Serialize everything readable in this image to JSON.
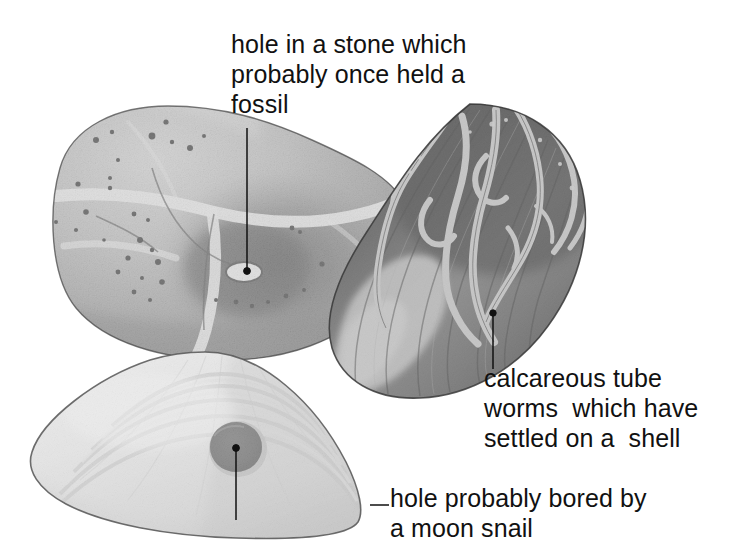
{
  "figure": {
    "kind": "labelled natural-history illustration",
    "background_color": "#ffffff",
    "ink_color": "#111111"
  },
  "labels": [
    {
      "id": "stone-hole",
      "name": "hole-in-stone-label",
      "text": "hole in a stone which\nprobably once held a\nfossil",
      "lines": [
        "hole in a stone which",
        "probably once held a",
        "fossil"
      ],
      "x": 231,
      "y": 29
    },
    {
      "id": "tube-worms",
      "name": "calcareous-tube-worms-label",
      "text": "calcareous tube\nworms  which have\nsettled on a  shell",
      "lines": [
        "calcareous tube",
        "worms  which have",
        "settled on a  shell"
      ],
      "x": 484,
      "y": 363
    },
    {
      "id": "moon-snail-hole",
      "name": "moon-snail-hole-label",
      "text": "hole probably bored by\na moon snail",
      "lines": [
        "hole probably bored by",
        "a moon snail"
      ],
      "x": 390,
      "y": 483
    }
  ],
  "leaders": [
    {
      "id": "leader-stone",
      "from": [
        247,
        128
      ],
      "to": [
        247,
        272
      ],
      "dot_at": [
        247,
        272
      ]
    },
    {
      "id": "leader-worms",
      "from": [
        493,
        368
      ],
      "to": [
        493,
        313
      ],
      "dot_at": [
        493,
        313
      ]
    },
    {
      "id": "leader-snail",
      "from": [
        236,
        447
      ],
      "to": [
        236,
        520
      ],
      "dot_at": [
        236,
        447
      ],
      "elbow": [
        [
          370,
          505
        ],
        [
          389,
          505
        ]
      ]
    }
  ],
  "specimens": [
    {
      "id": "stone",
      "name": "beach-stone",
      "description": "rounded grey beach stone with white quartz veins, dark mineral speckles and an oval hole",
      "tone": "#9a9a9a",
      "vein_color": "#ffffff",
      "hole": {
        "cx": 244,
        "cy": 272,
        "rx": 17,
        "ry": 9,
        "color": "#ffffff"
      }
    },
    {
      "id": "mussel",
      "name": "mussel-shell",
      "description": "dark elongated mussel shell encrusted with pale calcareous tube worms",
      "tone": "#4a4a4a",
      "worm_color": "#f2f2f2"
    },
    {
      "id": "clam",
      "name": "clam-shell",
      "description": "pale fan-shaped clam shell with concentric growth rings and a round bored hole",
      "tone": "#ececec",
      "hole": {
        "cx": 236,
        "cy": 447,
        "r": 26,
        "color": "#585858"
      }
    }
  ]
}
